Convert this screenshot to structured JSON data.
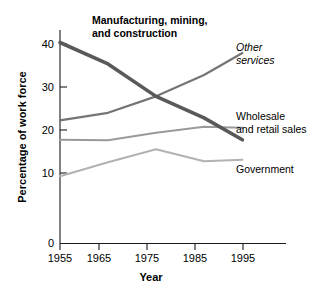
{
  "chart_data": {
    "type": "line",
    "title": "",
    "xlabel": "Year",
    "ylabel": "Percentage of work force",
    "x": [
      1955,
      1965,
      1975,
      1985,
      1993
    ],
    "xlim": [
      1955,
      2000
    ],
    "ylim": [
      0,
      42
    ],
    "xticks": [
      "1955",
      "1965",
      "1975",
      "1985",
      "1995"
    ],
    "yticks": [
      "0",
      "10",
      "20",
      "30",
      "40"
    ],
    "grid": false,
    "legend_position": "inline-annotations",
    "series": [
      {
        "name": "Manufacturing, mining, and construction",
        "values": [
          40.3,
          36.0,
          29.5,
          25.2,
          20.8
        ],
        "color": "#595959",
        "width": 3.6,
        "label_style": "bold"
      },
      {
        "name": "Other services",
        "values": [
          24.7,
          26.2,
          29.5,
          33.8,
          38.2
        ],
        "color": "#757575",
        "width": 2.2,
        "label_style": "italic"
      },
      {
        "name": "Wholesale and retail sales",
        "values": [
          20.8,
          20.7,
          22.2,
          23.4,
          23.2
        ],
        "color": "#9a9a9a",
        "width": 2.0,
        "label_style": "regular"
      },
      {
        "name": "Government",
        "values": [
          13.5,
          16.3,
          18.9,
          16.5,
          16.8
        ],
        "color": "#b2b2b2",
        "width": 2.0,
        "label_style": "regular"
      }
    ]
  },
  "annotations": {
    "manufacturing": {
      "line1": "Manufacturing, mining,",
      "line2": "and construction"
    },
    "other_services": {
      "line1": "Other",
      "line2": "services"
    },
    "wholesale": {
      "line1": "Wholesale",
      "line2": "and retail sales"
    },
    "government": {
      "line1": "Government"
    }
  },
  "axes": {
    "y_title": "Percentage of work force",
    "x_title": "Year",
    "y_tick_labels": [
      "40",
      "30",
      "20",
      "10",
      "0"
    ],
    "x_tick_labels": [
      "1955",
      "1965",
      "1975",
      "1985",
      "1995"
    ]
  }
}
